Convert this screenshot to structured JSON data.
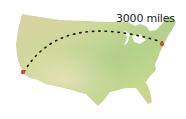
{
  "map": {
    "subject": "United States",
    "route": {
      "from": {
        "name": "Los Angeles",
        "x": 23,
        "y": 72,
        "color": "#e0453a"
      },
      "to": {
        "name": "New York",
        "x": 162,
        "y": 44,
        "color": "#e0453a"
      },
      "style": "dotted-arc",
      "color": "#1a1a1a"
    },
    "distance_label": "3000 miles",
    "land_colors": [
      "#c9d88a",
      "#b5cf7a",
      "#d8d1a2",
      "#a8cf86",
      "#e3c78f"
    ]
  }
}
